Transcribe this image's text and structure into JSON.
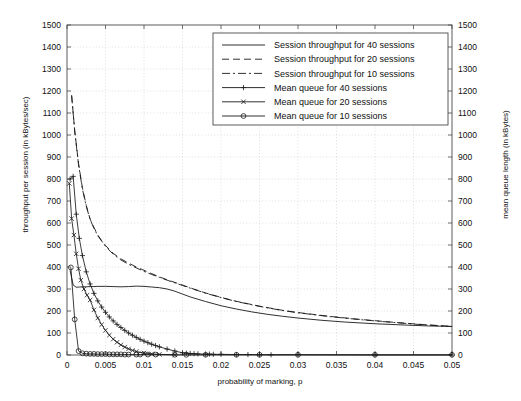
{
  "chart_data": {
    "type": "line",
    "title": "",
    "xlabel": "probability of marking, p",
    "ylabel": "throughput per session (in kBytes/sec)",
    "ylabel_right": "mean queue length (in kBytes)",
    "xlim": [
      0,
      0.05
    ],
    "ylim": [
      0,
      1500
    ],
    "ylim_right": [
      0,
      1500
    ],
    "xticks": [
      0,
      0.005,
      0.01,
      0.015,
      0.02,
      0.025,
      0.03,
      0.035,
      0.04,
      0.045,
      0.05
    ],
    "xticklabels": [
      "0",
      "0.005",
      "0.01",
      "0.015",
      "0.02",
      "0.025",
      "0.03",
      "0.035",
      "0.04",
      "0.045",
      "0.05"
    ],
    "yticks": [
      0,
      100,
      200,
      300,
      400,
      500,
      600,
      700,
      800,
      900,
      1000,
      1100,
      1200,
      1300,
      1400,
      1500
    ],
    "yticklabels": [
      "0",
      "100",
      "200",
      "300",
      "400",
      "500",
      "600",
      "700",
      "800",
      "900",
      "1000",
      "1100",
      "1200",
      "1300",
      "1400",
      "1500"
    ],
    "grid": true,
    "legend_position": "upper-right",
    "series": [
      {
        "name": "Session throughput for 40 sessions",
        "style": "solid",
        "marker": "none",
        "x": [
          0.0004,
          0.0008,
          0.0012,
          0.0016,
          0.002,
          0.0025,
          0.003,
          0.0035,
          0.004,
          0.005,
          0.006,
          0.007,
          0.008,
          0.009,
          0.01,
          0.011,
          0.012,
          0.013,
          0.014,
          0.015,
          0.016,
          0.018,
          0.02,
          0.022,
          0.024,
          0.026,
          0.028,
          0.03,
          0.033,
          0.036,
          0.04,
          0.044,
          0.047,
          0.05
        ],
        "y": [
          385,
          318,
          308,
          309,
          310,
          310,
          311,
          311,
          312,
          312,
          311,
          310,
          311,
          313,
          312,
          309,
          306,
          300,
          290,
          277,
          264,
          243,
          224,
          209,
          196,
          185,
          176,
          168,
          158,
          150,
          142,
          136,
          132,
          130
        ]
      },
      {
        "name": "Session throughput for 20 sessions",
        "style": "dashed",
        "marker": "none",
        "x": [
          0.0006,
          0.001,
          0.0015,
          0.002,
          0.0025,
          0.003,
          0.0035,
          0.004,
          0.0045,
          0.005,
          0.006,
          0.007,
          0.008,
          0.009,
          0.01,
          0.011,
          0.012,
          0.013,
          0.014,
          0.015,
          0.016,
          0.018,
          0.02,
          0.022,
          0.025,
          0.028,
          0.03,
          0.034,
          0.038,
          0.042,
          0.046,
          0.05
        ],
        "y": [
          1180,
          1020,
          870,
          760,
          680,
          618,
          580,
          545,
          520,
          498,
          462,
          437,
          418,
          400,
          385,
          370,
          355,
          342,
          330,
          318,
          305,
          282,
          262,
          244,
          222,
          203,
          193,
          176,
          162,
          150,
          139,
          130
        ]
      },
      {
        "name": "Session throughput for 10 sessions",
        "style": "dashdot",
        "marker": "none",
        "x": [
          0.0006,
          0.001,
          0.0015,
          0.002,
          0.0025,
          0.003,
          0.0035,
          0.004,
          0.005,
          0.006,
          0.007,
          0.008,
          0.009,
          0.01,
          0.011,
          0.012,
          0.013,
          0.014,
          0.015,
          0.016,
          0.018,
          0.02,
          0.022,
          0.025,
          0.028,
          0.03,
          0.034,
          0.038,
          0.042,
          0.046,
          0.05
        ],
        "y": [
          1180,
          1018,
          865,
          755,
          676,
          616,
          576,
          542,
          494,
          458,
          432,
          412,
          396,
          380,
          366,
          353,
          340,
          328,
          316,
          304,
          281,
          261,
          243,
          221,
          202,
          192,
          175,
          161,
          149,
          138,
          129
        ]
      },
      {
        "name": "Mean queue for 40 sessions",
        "style": "solid",
        "marker": "plus",
        "x": [
          0.0004,
          0.0008,
          0.0012,
          0.0016,
          0.002,
          0.0025,
          0.003,
          0.0035,
          0.004,
          0.0045,
          0.005,
          0.0055,
          0.006,
          0.0065,
          0.007,
          0.0075,
          0.008,
          0.0085,
          0.009,
          0.0095,
          0.01,
          0.0105,
          0.011,
          0.0115,
          0.012,
          0.013,
          0.014,
          0.015,
          0.0155,
          0.016,
          0.0165,
          0.017,
          0.018,
          0.0185,
          0.019,
          0.02,
          0.022,
          0.0235,
          0.025,
          0.0265,
          0.03,
          0.04,
          0.05
        ],
        "y": [
          800,
          812,
          640,
          530,
          452,
          378,
          323,
          280,
          246,
          218,
          194,
          173,
          155,
          139,
          125,
          112,
          100,
          90,
          80,
          71,
          63,
          56,
          49,
          43,
          37,
          27,
          18,
          10,
          8,
          7,
          6,
          5,
          4,
          4,
          3,
          3,
          2,
          2,
          1,
          1,
          1,
          0,
          0
        ]
      },
      {
        "name": "Mean queue for 20 sessions",
        "style": "solid",
        "marker": "cross",
        "x": [
          0.0003,
          0.0006,
          0.0009,
          0.0012,
          0.0015,
          0.0018,
          0.0022,
          0.0026,
          0.003,
          0.0035,
          0.004,
          0.0045,
          0.005,
          0.0055,
          0.006,
          0.0065,
          0.007,
          0.0075,
          0.008,
          0.0085,
          0.009,
          0.01,
          0.011,
          0.012,
          0.014
        ],
        "y": [
          780,
          620,
          545,
          460,
          392,
          340,
          300,
          272,
          250,
          205,
          168,
          138,
          112,
          90,
          72,
          58,
          46,
          36,
          28,
          21,
          16,
          9,
          5,
          3,
          1
        ]
      },
      {
        "name": "Mean queue for 10 sessions",
        "style": "solid",
        "marker": "circle",
        "x": [
          0.0005,
          0.001,
          0.0015,
          0.002,
          0.0025,
          0.003,
          0.0035,
          0.004,
          0.0045,
          0.005,
          0.0055,
          0.006,
          0.0065,
          0.007,
          0.0075,
          0.008,
          0.009,
          0.0095,
          0.0105,
          0.0115,
          0.014,
          0.0155,
          0.018,
          0.022,
          0.025,
          0.03,
          0.04,
          0.05
        ],
        "y": [
          398,
          162,
          18,
          8,
          6,
          5,
          5,
          4,
          4,
          4,
          3,
          3,
          3,
          3,
          2,
          2,
          2,
          2,
          2,
          2,
          1,
          1,
          1,
          1,
          1,
          1,
          1,
          1
        ]
      }
    ]
  },
  "legend": {
    "items": [
      {
        "label": "Session throughput for 40 sessions",
        "style": "solid",
        "marker": "none"
      },
      {
        "label": "Session throughput for 20 sessions",
        "style": "dashed",
        "marker": "none"
      },
      {
        "label": "Session throughput for 10 sessions",
        "style": "dashdot",
        "marker": "none"
      },
      {
        "label": "Mean queue for 40 sessions",
        "style": "solid",
        "marker": "plus"
      },
      {
        "label": "Mean queue for 20 sessions",
        "style": "solid",
        "marker": "cross"
      },
      {
        "label": "Mean queue for 10 sessions",
        "style": "solid",
        "marker": "circle"
      }
    ]
  }
}
